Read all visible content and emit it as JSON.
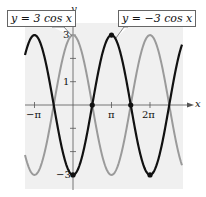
{
  "chart_data": {
    "type": "line",
    "title": "",
    "xlabel": "x",
    "ylabel": "y",
    "x_ticks": [
      {
        "value": -3.14159,
        "label": "−π"
      },
      {
        "value": 3.14159,
        "label": "π"
      },
      {
        "value": 6.28318,
        "label": "2π"
      }
    ],
    "y_ticks": [
      {
        "value": 3,
        "label": "3"
      },
      {
        "value": 2,
        "label": ""
      },
      {
        "value": 1,
        "label": "1"
      },
      {
        "value": -1,
        "label": ""
      },
      {
        "value": -2,
        "label": ""
      },
      {
        "value": -3,
        "label": "−3"
      }
    ],
    "xlim": [
      -3.93,
      8.9
    ],
    "ylim": [
      -3.6,
      3.8
    ],
    "grid": false,
    "series": [
      {
        "name": "y = 3 cos x",
        "expression": "3*cos(x)",
        "amplitude": 3,
        "color": "#9a9a9a"
      },
      {
        "name": "y = −3 cos x",
        "expression": "-3*cos(x)",
        "amplitude": -3,
        "color": "#111111"
      }
    ],
    "highlighted_points": [
      {
        "x": 0,
        "y": -3
      },
      {
        "x": 1.5708,
        "y": 0
      },
      {
        "x": 4.7124,
        "y": 0
      },
      {
        "x": 3.14159,
        "y": 3
      },
      {
        "x": 6.28318,
        "y": -3
      }
    ],
    "annotations": [
      {
        "text": "y = 3 cos x",
        "points_to": "gray curve"
      },
      {
        "text": "y = −3 cos x",
        "points_to": "black curve"
      }
    ]
  },
  "labels": {
    "y_axis": "y",
    "x_axis": "x",
    "tick_3": "3",
    "tick_1": "1",
    "tick_neg3": "−3",
    "tick_negpi": "−π",
    "tick_pi": "π",
    "tick_2pi": "2π",
    "callout_left": "y = 3 cos x",
    "callout_right": "y = −3 cos x"
  }
}
